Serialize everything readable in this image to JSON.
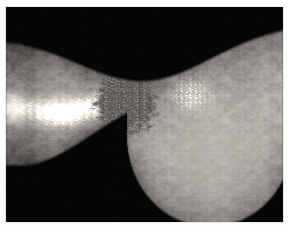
{
  "image": {
    "kind": "clinical-photograph",
    "modality": "grayscale-macro-photo",
    "subject": "skin lesion on limb (ankle/wrist region)",
    "background_color": "#000000",
    "frame_color": "#fdfdfd",
    "frame_border_color": "#e9e9e9",
    "frame": {
      "x": 6,
      "y": 7,
      "width": 277,
      "height": 215
    },
    "canvas": {
      "width": 289,
      "height": 232
    },
    "palette": {
      "black_background": "#000000",
      "skin_dark": "#3a3a38",
      "skin_mid": "#6e6c66",
      "skin_light": "#9c9a93",
      "skin_highlight": "#d8d5cc",
      "specular_white": "#f2f0ea",
      "crust_dark": "#141312",
      "crust_mid": "#2b2926"
    },
    "regions": [
      {
        "name": "upper-black-background",
        "description": "black field above the limb, lower edge dips concave toward the centre"
      },
      {
        "name": "left-limb-shaft",
        "description": "tapering limb entering from the left, mid-grey skin with a bright specular highlight band running horizontally across its middle"
      },
      {
        "name": "central-lesion",
        "description": "dark irregular crusted ulcerated plaque at the centre with rough granular texture and scattered dark punctate crusts"
      },
      {
        "name": "right-skin-field",
        "description": "broad lighter skin area on the right bearing a raised bright scaly patch"
      },
      {
        "name": "lower-right-protrusion",
        "description": "rounded heel-like bulge descending at the lower right, smooth and evenly lit"
      },
      {
        "name": "lower-left-black-background",
        "description": "black field below the limb, its upper edge sweeps up steeply from left to centre"
      }
    ]
  }
}
